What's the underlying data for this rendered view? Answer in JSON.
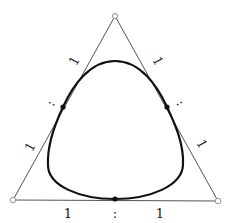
{
  "diagram": {
    "type": "triangle-with-inscribed-curve",
    "colors": {
      "triangle": "#555555",
      "curve": "#111111",
      "tangent_point": "#111111",
      "vertex_fill": "#ffffff",
      "label": "#222222"
    },
    "vertices": [
      {
        "name": "top",
        "x": 115,
        "y": 16
      },
      {
        "name": "bottom-left",
        "x": 13,
        "y": 200
      },
      {
        "name": "bottom-right",
        "x": 218,
        "y": 201
      }
    ],
    "tangent_points": [
      {
        "side": "left",
        "x": 63,
        "y": 107
      },
      {
        "side": "right",
        "x": 167,
        "y": 107
      },
      {
        "side": "bottom",
        "x": 115,
        "y": 199
      }
    ],
    "side_labels": {
      "left": {
        "upper": "1",
        "separator": ":",
        "lower": "1"
      },
      "right": {
        "upper": "1",
        "separator": ":",
        "lower": "1"
      },
      "bottom": {
        "left": "1",
        "separator": ":",
        "right": "1"
      }
    }
  }
}
